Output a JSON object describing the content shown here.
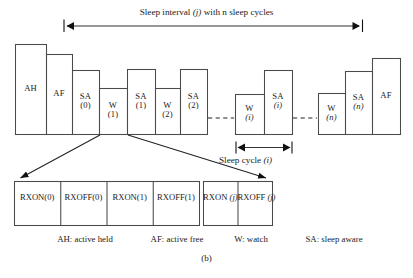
{
  "figure": {
    "caption": "(b)",
    "top_annotation": {
      "text_before": "Sleep interval ",
      "italic_var": "(j)",
      "text_after": " with n sleep cycles",
      "full_text": "Sleep interval (j) with n sleep cycles"
    },
    "cycle_annotation": {
      "text_before": "Sleep cycle ",
      "italic_var": "(i)",
      "full_text": "Sleep cycle (i)"
    }
  },
  "timeline": {
    "blocks": [
      {
        "name": "ah",
        "label": "AH",
        "sub": "",
        "sub_italic": false,
        "x": 15,
        "w": 31,
        "top": 44
      },
      {
        "name": "af1",
        "label": "AF",
        "sub": "",
        "sub_italic": false,
        "x": 46,
        "w": 26,
        "top": 54
      },
      {
        "name": "sa0",
        "label": "SA",
        "sub": "(0)",
        "sub_italic": false,
        "x": 72,
        "w": 27,
        "top": 70
      },
      {
        "name": "w1",
        "label": "W",
        "sub": "(1)",
        "sub_italic": false,
        "x": 99,
        "w": 28,
        "top": 88
      },
      {
        "name": "sa1",
        "label": "SA",
        "sub": "(1)",
        "sub_italic": false,
        "x": 127,
        "w": 28,
        "top": 69
      },
      {
        "name": "w2",
        "label": "W",
        "sub": "(2)",
        "sub_italic": false,
        "x": 155,
        "w": 25,
        "top": 88
      },
      {
        "name": "sa2",
        "label": "SA",
        "sub": "(2)",
        "sub_italic": false,
        "x": 180,
        "w": 27,
        "top": 69
      },
      {
        "name": "wi",
        "label": "W",
        "sub": "(i)",
        "sub_italic": true,
        "x": 235,
        "w": 29,
        "top": 94
      },
      {
        "name": "sai",
        "label": "SA",
        "sub": "(i)",
        "sub_italic": true,
        "x": 264,
        "w": 28,
        "top": 70
      },
      {
        "name": "wn",
        "label": "W",
        "sub": "(n)",
        "sub_italic": true,
        "x": 318,
        "w": 27,
        "top": 93
      },
      {
        "name": "san",
        "label": "SA",
        "sub": "(n)",
        "sub_italic": true,
        "x": 345,
        "w": 27,
        "top": 71
      },
      {
        "name": "af2",
        "label": "AF",
        "sub": "",
        "sub_italic": false,
        "x": 372,
        "w": 28,
        "top": 58
      }
    ],
    "baseline_y": 134
  },
  "rx_groups": [
    {
      "name": "rx-group-left",
      "x": 14,
      "y": 181,
      "w": 185,
      "h": 44,
      "cells": [
        {
          "name": "rx-on-0",
          "line1": "RX",
          "line2": "ON(0)",
          "italic_var": ""
        },
        {
          "name": "rx-off-0",
          "line1": "RX",
          "line2": "OFF(0)",
          "italic_var": ""
        },
        {
          "name": "rx-on-1",
          "line1": "RX",
          "line2": "ON(1)",
          "italic_var": ""
        },
        {
          "name": "rx-off-1",
          "line1": "RX",
          "line2": "OFF(1)",
          "italic_var": ""
        }
      ]
    },
    {
      "name": "rx-group-right",
      "x": 203,
      "y": 181,
      "w": 69,
      "h": 44,
      "cells": [
        {
          "name": "rx-on-j",
          "line1": "RX",
          "line2": "ON ",
          "italic_var": "(j)"
        },
        {
          "name": "rx-off-j",
          "line1": "RX",
          "line2": "OFF ",
          "italic_var": "(j)"
        }
      ]
    }
  ],
  "legend": {
    "items": [
      {
        "name": "legend-ah",
        "text": "AH: active held"
      },
      {
        "name": "legend-af",
        "text": "AF: active free"
      },
      {
        "name": "legend-w",
        "text": "W: watch"
      },
      {
        "name": "legend-sa",
        "text": "SA: sleep aware"
      }
    ]
  },
  "colors": {
    "stroke": "#4a4a4a",
    "text": "#1a1a1a",
    "background": "#ffffff"
  }
}
